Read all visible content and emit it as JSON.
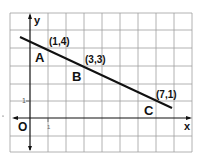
{
  "diagram": {
    "axes": {
      "x_label": "x",
      "y_label": "y",
      "origin_label": "O",
      "tick_x": "1",
      "tick_y": "1"
    },
    "points": [
      {
        "name": "A",
        "coord": "(1,4)",
        "x": 1,
        "y": 4
      },
      {
        "name": "B",
        "coord": "(3,3)",
        "x": 3,
        "y": 3
      },
      {
        "name": "C",
        "coord": "(7,1)",
        "x": 7,
        "y": 1
      }
    ],
    "colors": {
      "grid": "#9a9a9a",
      "ink": "#111111",
      "background": "#ffffff"
    }
  }
}
